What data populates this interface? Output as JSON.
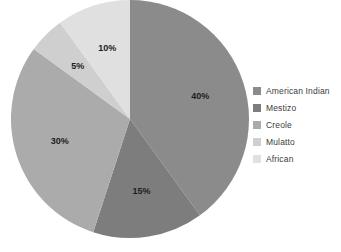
{
  "chart_data": {
    "type": "pie",
    "title": "",
    "categories": [
      "American Indian",
      "Mestizo",
      "Creole",
      "Mulatto",
      "African"
    ],
    "values": [
      40,
      15,
      30,
      5,
      10
    ],
    "value_labels": [
      "40%",
      "15%",
      "30%",
      "5%",
      "10%"
    ],
    "colors": [
      "#8b8b8b",
      "#7d7d7d",
      "#ababab",
      "#cfcfcf",
      "#e0e0e0"
    ],
    "start_angle_deg": 0,
    "direction": "clockwise",
    "units": "percent",
    "total": 100,
    "legend": {
      "position": "right",
      "entries": [
        {
          "label": "American Indian",
          "color": "#8b8b8b",
          "value": 40,
          "value_label": "40%"
        },
        {
          "label": "Mestizo",
          "color": "#7d7d7d",
          "value": 15,
          "value_label": "15%"
        },
        {
          "label": "Creole",
          "color": "#ababab",
          "value": 30,
          "value_label": "30%"
        },
        {
          "label": "Mulatto",
          "color": "#cfcfcf",
          "value": 5,
          "value_label": "5%"
        },
        {
          "label": "African",
          "color": "#e0e0e0",
          "value": 10,
          "value_label": "10%"
        }
      ]
    },
    "geometry": {
      "center_x": 130,
      "center_y": 119,
      "radius": 119,
      "label_radius_fraction": 0.62
    },
    "background_color": "#ffffff",
    "label_color": "#1d1d1d"
  }
}
